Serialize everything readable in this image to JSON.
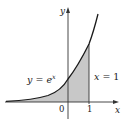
{
  "figure": {
    "type": "area-under-curve",
    "function_label": "y = e^x",
    "function_label_parts": {
      "lhs": "y",
      "eq": " = ",
      "base": "e",
      "exp": "x"
    },
    "boundary_label": "x = 1",
    "boundary_label_parts": {
      "lhs": "x",
      "eq": " = ",
      "rhs": "1"
    },
    "axes": {
      "x_label": "x",
      "y_label": "y",
      "ticks": [
        {
          "value": 0,
          "label": "0"
        },
        {
          "value": 1,
          "label": "1"
        }
      ]
    },
    "shaded_region": {
      "description": "Region under y = e^x from x = -infinity (left) to x = 1",
      "x_from": "-inf",
      "x_to": 1
    },
    "colors": {
      "curve": "#1a1a1a",
      "axes": "#333333",
      "fill": "#c8c8c8",
      "text": "#222222"
    }
  }
}
